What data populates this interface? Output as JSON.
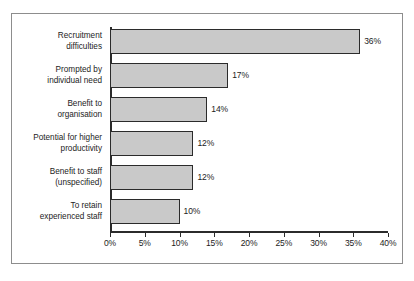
{
  "figure": {
    "background_color": "#ffffff",
    "frame_color": "#8d8d8d",
    "axis_color": "#2b2b2b",
    "bar_fill_color": "#c9c9c9",
    "bar_edge_color": "#2b2b2b",
    "text_color": "#1c1c1c"
  },
  "chart_data": {
    "type": "bar",
    "orientation": "horizontal",
    "title": "",
    "subtitle": "",
    "xlabel": "",
    "ylabel": "",
    "xlim": [
      0,
      40
    ],
    "xtick_step": 5,
    "grid": false,
    "legend": null,
    "categories": [
      "Recruitment\ndifficulties",
      "Prompted by\nindividual need",
      "Benefit to\norganisation",
      "Potential for higher\nproductivity",
      "Benefit to staff\n(unspecified)",
      "To retain\nexperienced staff"
    ],
    "values": [
      36,
      17,
      14,
      12,
      12,
      10
    ],
    "value_labels": [
      "36%",
      "17%",
      "14%",
      "12%",
      "12%",
      "10%"
    ],
    "xtick_labels": [
      "0%",
      "5%",
      "10%",
      "15%",
      "20%",
      "25%",
      "30%",
      "35%",
      "40%"
    ],
    "xtick_values": [
      0,
      5,
      10,
      15,
      20,
      25,
      30,
      35,
      40
    ]
  }
}
